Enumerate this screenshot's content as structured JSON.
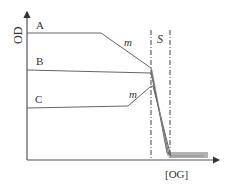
{
  "diagram": {
    "axes": {
      "y_label": "OD",
      "x_label": "[OG]"
    },
    "curves": [
      {
        "label": "A"
      },
      {
        "label": "B"
      },
      {
        "label": "C"
      }
    ],
    "annotations": {
      "m_top": "m",
      "m_bottom": "m",
      "region": "S"
    },
    "colors": {
      "line": "#555555",
      "text": "#333333"
    }
  }
}
